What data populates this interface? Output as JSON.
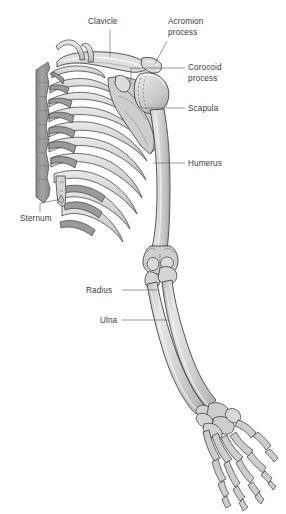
{
  "figure": {
    "background_color": "#ffffff",
    "colors": {
      "bone_light": "#d2d2d2",
      "bone_mid": "#c2c2c2",
      "bone_shadow": "#a8a8a8",
      "cartilage": "#9a9a9a",
      "vertebrae": "#969696",
      "outline": "#3c3c3c",
      "highlight": "#f2f2f2",
      "label_text": "#3a3a3a",
      "leader_line": "#6e6e6e"
    }
  },
  "labels": [
    {
      "id": "clavicle",
      "text": "Clavicle",
      "x": 88,
      "y": 17,
      "align": "left"
    },
    {
      "id": "acromion-process",
      "text": "Acromion\nprocess",
      "line1": "Acromion",
      "line2": "process",
      "x": 168,
      "y": 17,
      "align": "left"
    },
    {
      "id": "corocoid-process",
      "text": "Corocoid\nprocess",
      "line1": "Corocoid",
      "line2": "process",
      "x": 188,
      "y": 63,
      "align": "left"
    },
    {
      "id": "scapula",
      "text": "Scapula",
      "x": 188,
      "y": 104,
      "align": "left"
    },
    {
      "id": "humerus",
      "text": "Humerus",
      "x": 188,
      "y": 159,
      "align": "left"
    },
    {
      "id": "sternum",
      "text": "Sternum",
      "x": 20,
      "y": 214,
      "align": "left"
    },
    {
      "id": "radius",
      "text": "Radius",
      "x": 86,
      "y": 286,
      "align": "left"
    },
    {
      "id": "ulna",
      "text": "Ulna",
      "x": 100,
      "y": 316,
      "align": "left"
    }
  ],
  "bones": [
    {
      "id": "vertebral-column",
      "name": "Vertebral column (thoracic vertebrae)"
    },
    {
      "id": "clavicle-bone",
      "name": "Clavicle"
    },
    {
      "id": "acromion",
      "name": "Acromion process of scapula"
    },
    {
      "id": "coracoid",
      "name": "Coracoid process of scapula"
    },
    {
      "id": "scapula-bone",
      "name": "Scapula"
    },
    {
      "id": "humerus-bone",
      "name": "Humerus"
    },
    {
      "id": "ribs",
      "name": "Ribs with costal cartilage"
    },
    {
      "id": "sternum-bone",
      "name": "Sternum"
    },
    {
      "id": "radius-bone",
      "name": "Radius"
    },
    {
      "id": "ulna-bone",
      "name": "Ulna"
    },
    {
      "id": "carpals",
      "name": "Carpal bones"
    },
    {
      "id": "metacarpals",
      "name": "Metacarpal bones"
    },
    {
      "id": "phalanges",
      "name": "Phalanges"
    }
  ]
}
